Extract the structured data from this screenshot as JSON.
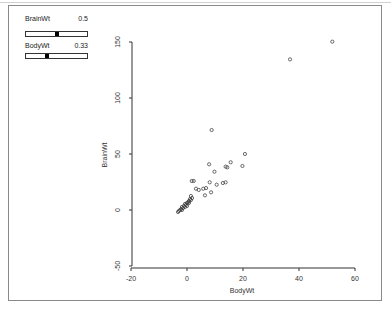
{
  "controls": {
    "sliders": [
      {
        "label": "BrainWt",
        "value": "0.5",
        "position": 0.5
      },
      {
        "label": "BodyWt",
        "value": "0.33",
        "position": 0.33
      }
    ]
  },
  "chart_data": {
    "type": "scatter",
    "title": "",
    "xlabel": "BodyWt",
    "ylabel": "BrainWt",
    "xlim": [
      -20,
      60
    ],
    "ylim": [
      -50,
      150
    ],
    "xticks": [
      -20,
      0,
      20,
      40,
      60
    ],
    "yticks": [
      -50,
      0,
      50,
      100,
      150
    ],
    "grid": false,
    "marker": "open-circle",
    "points": [
      [
        -3.2,
        -1.8
      ],
      [
        -2.9,
        -0.9
      ],
      [
        -2.5,
        0
      ],
      [
        -2.1,
        0.9
      ],
      [
        -1.8,
        0
      ],
      [
        -1.8,
        2.7
      ],
      [
        -1.4,
        1.8
      ],
      [
        -1.1,
        3.6
      ],
      [
        -0.7,
        2.7
      ],
      [
        -0.7,
        5.4
      ],
      [
        -0.4,
        4.5
      ],
      [
        0,
        6.3
      ],
      [
        0,
        3.6
      ],
      [
        0.4,
        7.1
      ],
      [
        0.7,
        8.0
      ],
      [
        0.7,
        6.3
      ],
      [
        1.1,
        9.8
      ],
      [
        1.4,
        8.9
      ],
      [
        1.4,
        12.5
      ],
      [
        1.8,
        10.7
      ],
      [
        1.7,
        25.9
      ],
      [
        2.4,
        25.9
      ],
      [
        3.2,
        19
      ],
      [
        4.2,
        17.9
      ],
      [
        5.8,
        19
      ],
      [
        6.8,
        19.6
      ],
      [
        6.4,
        13.1
      ],
      [
        8.1,
        24.7
      ],
      [
        8.6,
        15.8
      ],
      [
        7.9,
        40.8
      ],
      [
        8.8,
        71.4
      ],
      [
        9.8,
        34.2
      ],
      [
        10.6,
        22.6
      ],
      [
        12.8,
        24.1
      ],
      [
        13.8,
        24.7
      ],
      [
        13.8,
        38.7
      ],
      [
        14.4,
        38.1
      ],
      [
        15.6,
        42.6
      ],
      [
        19.8,
        39.3
      ],
      [
        20.7,
        50
      ],
      [
        36.8,
        134.5
      ],
      [
        51.9,
        150.3
      ]
    ]
  }
}
